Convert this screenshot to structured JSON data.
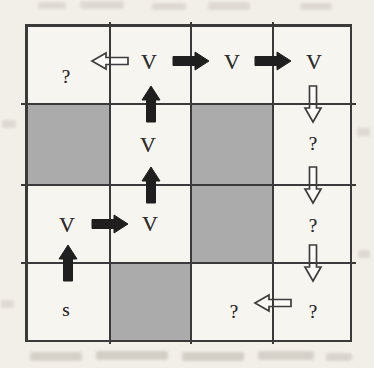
{
  "figure": {
    "type": "grid-search-diagram",
    "grid": {
      "rows": 4,
      "cols": 4,
      "cells": [
        [
          "?",
          "V",
          "V",
          "V"
        ],
        [
          "",
          "V",
          "",
          "?"
        ],
        [
          "V",
          "V",
          "",
          "?"
        ],
        [
          "s",
          "",
          "?",
          "?"
        ]
      ],
      "shaded_cells": [
        [
          1,
          0
        ],
        [
          1,
          2
        ],
        [
          2,
          2
        ],
        [
          3,
          1
        ]
      ]
    },
    "arrows": [
      {
        "dir": "left",
        "style": "outline",
        "row": 0,
        "cols": [
          1,
          0
        ]
      },
      {
        "dir": "right",
        "style": "solid",
        "row": 0,
        "cols": [
          1,
          2
        ]
      },
      {
        "dir": "right",
        "style": "solid",
        "row": 0,
        "cols": [
          2,
          3
        ]
      },
      {
        "dir": "down",
        "style": "outline",
        "col": 3,
        "rows": [
          0,
          1
        ]
      },
      {
        "dir": "up",
        "style": "solid",
        "col": 1,
        "rows": [
          1,
          0
        ]
      },
      {
        "dir": "up",
        "style": "solid",
        "col": 1,
        "rows": [
          2,
          1
        ]
      },
      {
        "dir": "down",
        "style": "outline",
        "col": 3,
        "rows": [
          1,
          2
        ]
      },
      {
        "dir": "right",
        "style": "solid",
        "row": 2,
        "cols": [
          0,
          1
        ]
      },
      {
        "dir": "up",
        "style": "solid",
        "col": 0,
        "rows": [
          3,
          2
        ]
      },
      {
        "dir": "down",
        "style": "outline",
        "col": 3,
        "rows": [
          2,
          3
        ]
      },
      {
        "dir": "left",
        "style": "outline",
        "row": 3,
        "cols": [
          3,
          2
        ]
      }
    ],
    "colors": {
      "paper": "#f2efe9",
      "cell_white": "#f7f5f0",
      "cell_shaded": "#ababab",
      "grid_line": "#3a3a3a",
      "arrow_solid": "#1f1f1f",
      "arrow_outline_fill": "#fcfbf8",
      "arrow_outline_stroke": "#3d3d3d"
    }
  }
}
